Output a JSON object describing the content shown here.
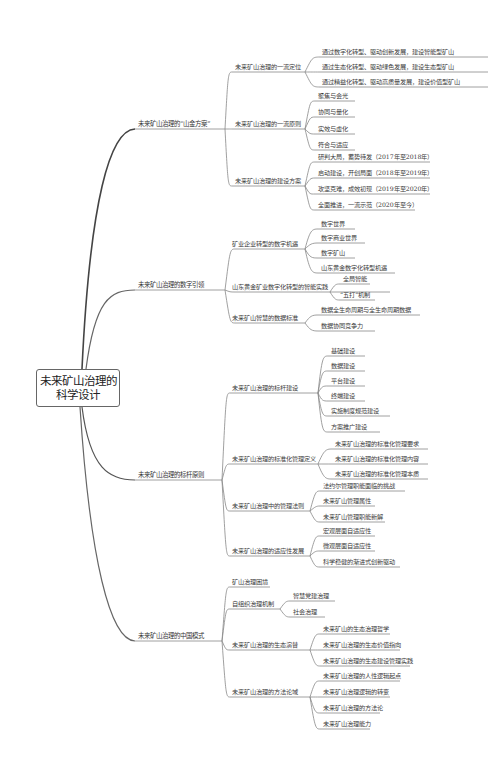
{
  "root": {
    "line1": "未来矿山治理的",
    "line2": "科学设计"
  },
  "branches": [
    {
      "label": "未来矿山治理的“山金方案”",
      "children": [
        {
          "label": "未来矿山治理的一流定位",
          "children": [
            "通过数字化转型、驱动创新发展，建设智能型矿山",
            "通过生态化转型、驱动绿色发展，建设生态型矿山",
            "通过精益化转型、驱动高质量发展，建设价值型矿山"
          ]
        },
        {
          "label": "未来矿山治理的一流原则",
          "children": [
            "聚焦与会光",
            "协同与量化",
            "实效与虚化",
            "符合与适应"
          ]
        },
        {
          "label": "未来矿山治理的建设方案",
          "children": [
            "研判大局，蓄势待发（2017年至2018年）",
            "启动建设，开创局面（2018年至2019年）",
            "攻坚克难，成效初现（2019年至2020年）",
            "全面推进，一流示范（2020年至今）"
          ]
        }
      ]
    },
    {
      "label": "未来矿山治理的数字引领",
      "children": [
        {
          "label": "矿业企业转型的数字机遇",
          "children": [
            "数字世界",
            "数字商业世界",
            "数字矿山",
            "山东黄金数字化转型机遇"
          ]
        },
        {
          "label": "山东黄金矿业数字化转型的智能实践",
          "children": [
            "全局智能",
            "“五打”机制"
          ]
        },
        {
          "label": "未来矿山智慧的数据标准",
          "children": [
            "数据全生命周期与全生命周期数据",
            "数据协同竞争力"
          ]
        }
      ]
    },
    {
      "label": "未来矿山治理的标杆原则",
      "children": [
        {
          "label": "未来矿山治理的标杆建设",
          "children": [
            "基础建设",
            "数据建设",
            "平台建设",
            "终端建设",
            "实施制度规范建设",
            "方案推广建设"
          ]
        },
        {
          "label": "未来矿山治理的标准化管理定义",
          "children": [
            "未来矿山治理的标准化管理要求",
            "未来矿山治理的标准化管理内容",
            "未来矿山治理的标准化管理本质"
          ]
        },
        {
          "label": "未来矿山治理中的管理法则",
          "children": [
            "法约尔管理职能面临的挑战",
            "未来矿山管理属性",
            "未来矿山管理职能新解"
          ]
        },
        {
          "label": "未来矿山治理的适应性发展",
          "children": [
            "宏观层面自适应性",
            "微观层面自适应性",
            "科学稳健的渐进式创新驱动"
          ]
        }
      ]
    },
    {
      "label": "未来矿山治理的中国模式",
      "children": [
        {
          "label": "矿山治理困境",
          "children": []
        },
        {
          "label": "自组织治理机制",
          "children": [
            "智慧党建治理",
            "社会治理"
          ]
        },
        {
          "label": "未来矿山治理的生态演替",
          "children": [
            "未来矿山的生态治理哲学",
            "未来矿山治理的生态价值指向",
            "未来矿山治理的生态建设管理实践"
          ]
        },
        {
          "label": "未来矿山治理的方法论域",
          "children": [
            "未来矿山治理的人性逻辑起点",
            "未来矿山治理逻辑的转变",
            "未来矿山治理的方法论",
            "未来矿山治理能力"
          ]
        }
      ]
    }
  ],
  "colors": {
    "line": "#777777",
    "line_dark": "#444444",
    "text": "#333333",
    "background": "#ffffff"
  }
}
